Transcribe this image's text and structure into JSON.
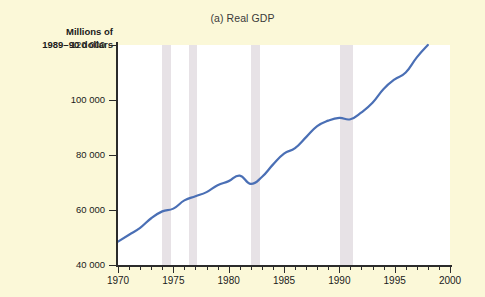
{
  "figure": {
    "title": "(a) Real GDP",
    "y_axis_label_line1": "Millions of",
    "y_axis_label_line2": "1989–90 dollars",
    "line_color": "#4a6fb5",
    "recession_band_color": "#ded7dd",
    "plot_background": "#ffffff",
    "page_background": "#fbf8d8"
  },
  "chart_data": {
    "type": "line",
    "title": "(a) Real GDP",
    "xlabel": "",
    "ylabel": "Millions of 1989–90 dollars",
    "xlim": [
      1970,
      2000
    ],
    "ylim": [
      40000,
      120000
    ],
    "xticks": [
      1970,
      1975,
      1980,
      1985,
      1990,
      1995,
      2000
    ],
    "xtick_labels": [
      "1970",
      "1975",
      "1980",
      "1985",
      "1990",
      "1995",
      "2000"
    ],
    "yticks": [
      40000,
      60000,
      80000,
      100000,
      120000
    ],
    "ytick_labels": [
      "40 000",
      "60 000",
      "80 000",
      "100 000",
      "120 000"
    ],
    "minor_xtick_interval": 1,
    "grid": false,
    "legend": null,
    "series": [
      {
        "name": "Real GDP",
        "color": "#4a6fb5",
        "x": [
          1970,
          1971,
          1972,
          1973,
          1974,
          1975,
          1976,
          1977,
          1978,
          1979,
          1980,
          1981,
          1982,
          1983,
          1984,
          1985,
          1986,
          1987,
          1988,
          1989,
          1990,
          1991,
          1992,
          1993,
          1994,
          1995,
          1996,
          1997,
          1998
        ],
        "values": [
          48500,
          51000,
          53500,
          57000,
          59500,
          60500,
          63500,
          65000,
          66500,
          69000,
          70500,
          72500,
          69500,
          72000,
          76500,
          80500,
          82500,
          86500,
          90500,
          92500,
          93500,
          93000,
          95500,
          99000,
          104000,
          107500,
          110000,
          115500,
          120000
        ]
      }
    ],
    "recession_bands": [
      {
        "label": "1974 recession",
        "start": 1974.0,
        "end": 1974.75
      },
      {
        "label": "1976 recession",
        "start": 1976.4,
        "end": 1977.15
      },
      {
        "label": "1982 recession",
        "start": 1982.0,
        "end": 1982.8
      },
      {
        "label": "1990–91 recession",
        "start": 1990.1,
        "end": 1991.2
      }
    ],
    "annotations": []
  }
}
